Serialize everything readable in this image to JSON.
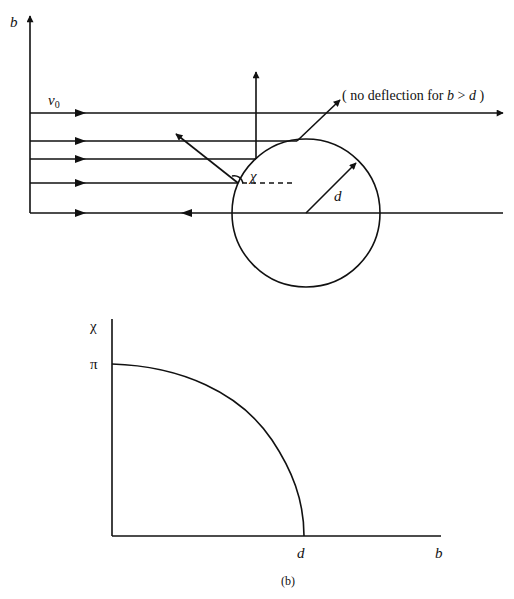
{
  "panel_a": {
    "y_axis_label": "b",
    "velocity_label": "v",
    "velocity_subscript": "0",
    "angle_label": "χ",
    "radius_label": "d",
    "annotation_prefix": "( no deflection for ",
    "annotation_b": "b",
    "annotation_op": " > ",
    "annotation_d": "d",
    "annotation_suffix": " )"
  },
  "panel_b": {
    "y_axis_label": "χ",
    "y_tick_label": "π",
    "x_tick_label": "d",
    "x_axis_label": "b",
    "caption": "(b)"
  },
  "colors": {
    "ink": "#111111",
    "background": "#ffffff"
  }
}
